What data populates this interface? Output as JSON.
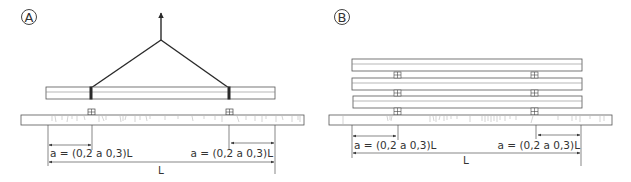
{
  "panels": [
    {
      "id": "A",
      "label": "A",
      "description": "Single timber lifted with two-leg sling over base timber",
      "dimensions": {
        "a_left": "a = (0,2 a 0,3)L",
        "a_right": "a = (0,2 a 0,3)L",
        "length": "L"
      }
    },
    {
      "id": "B",
      "label": "B",
      "description": "Three timbers stacked with spacer blocks over base timber",
      "dimensions": {
        "a_left": "a = (0,2 a 0,3)L",
        "a_right": "a = (0,2 a 0,3)L",
        "length": "L"
      }
    }
  ],
  "colors": {
    "line": "#3a3a3a",
    "thin": "#6a6a6a",
    "grain": "#b0b0b0",
    "background": "#ffffff"
  }
}
